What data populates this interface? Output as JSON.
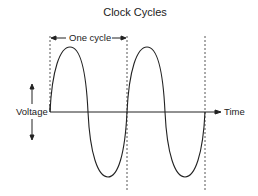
{
  "diagram": {
    "title": "Clock Cycles",
    "cycle_label": "One cycle",
    "y_axis_label": "Voltage",
    "x_axis_label": "Time",
    "cycles_shown": 2,
    "colors": {
      "line": "#222222",
      "dashed": "#444444",
      "background": "#ffffff"
    }
  }
}
